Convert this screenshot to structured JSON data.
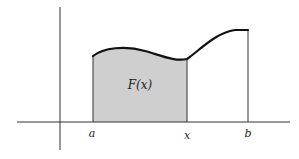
{
  "diagram": {
    "area_label": "F(x)",
    "x_labels": {
      "a": "a",
      "x": "x",
      "b": "b"
    },
    "colors": {
      "shade": "#cfcfcf",
      "curve": "#111111",
      "axis": "#333333",
      "background": "#ffffff"
    }
  }
}
